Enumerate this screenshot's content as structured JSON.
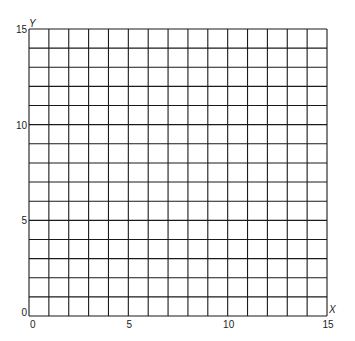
{
  "chart_data": {
    "type": "grid",
    "title": "",
    "xlabel": "X",
    "ylabel": "Y",
    "xlim": [
      0,
      15
    ],
    "ylim": [
      0,
      15
    ],
    "grid": true,
    "grid_step": 1,
    "x_ticks": [
      0,
      5,
      10,
      15
    ],
    "y_ticks": [
      0,
      5,
      10,
      15
    ],
    "x_tick_labels": [
      "0",
      "5",
      "10",
      "15"
    ],
    "y_tick_labels": [
      "0",
      "5",
      "10",
      "15"
    ],
    "series": [],
    "colors": {
      "grid": "#1a1a1a",
      "background": "#ffffff",
      "text": "#222222"
    }
  }
}
